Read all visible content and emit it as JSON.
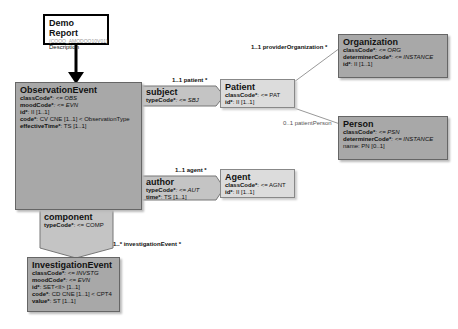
{
  "header": {
    "title": "Demo Report",
    "id": "(COOO_AMODOO10V01)",
    "description": "Description"
  },
  "observation_event": {
    "title": "ObservationEvent",
    "attrs": [
      {
        "name": "classCode*",
        "value": ": <= OBS"
      },
      {
        "name": "moodCode*",
        "value": ": <= EVN"
      },
      {
        "name": "id*",
        "value": ": II [1..1]"
      },
      {
        "name": "code*",
        "value": ": CV CNE [1..1] < ObservationType"
      },
      {
        "name": "effectiveTime*",
        "value": ": TS [1..1]"
      }
    ]
  },
  "subject": {
    "title": "subject",
    "attrs": [
      {
        "name": "typeCode*",
        "value": ": <= SBJ"
      }
    ],
    "label": "1..1 patient  *"
  },
  "patient": {
    "title": "Patient",
    "attrs": [
      {
        "name": "classCode*",
        "value": ": <= PAT"
      },
      {
        "name": "id*",
        "value": ": II [1..1]"
      }
    ]
  },
  "organization": {
    "title": "Organization",
    "label": "1..1 providerOrganization  *",
    "attrs": [
      {
        "name": "classCode*",
        "value": ": <= ORG"
      },
      {
        "name": "determinerCode*",
        "value": ": <= INSTANCE"
      },
      {
        "name": "id*",
        "value": ": II [1..1]"
      }
    ]
  },
  "person": {
    "title": "Person",
    "label": "0..1 patientPerson",
    "attrs": [
      {
        "name": "classCode*",
        "value": ": <= PSN"
      },
      {
        "name": "determinerCode*",
        "value": ": <= INSTANCE"
      },
      {
        "name": "name",
        "value": ": PN [0..1]"
      }
    ]
  },
  "author": {
    "title": "author",
    "label": "1..1 agent  *",
    "attrs": [
      {
        "name": "typeCode*",
        "value": ": <= AUT"
      },
      {
        "name": "time*",
        "value": ": TS [1..1]"
      }
    ]
  },
  "agent": {
    "title": "Agent",
    "attrs": [
      {
        "name": "classCode*",
        "value": ": <= AGNT"
      },
      {
        "name": "id*",
        "value": ": II [1..1]"
      }
    ]
  },
  "component": {
    "title": "component",
    "label": "1..* investigationEvent  *",
    "attrs": [
      {
        "name": "typeCode*",
        "value": ": <= COMP"
      }
    ]
  },
  "investigation_event": {
    "title": "InvestigationEvent",
    "attrs": [
      {
        "name": "classCode*",
        "value": ": <= INVSTG"
      },
      {
        "name": "moodCode*",
        "value": ": <= EVN"
      },
      {
        "name": "id*",
        "value": ": SET<II> [1..1]"
      },
      {
        "name": "code*",
        "value": ": CD CNE [1..1] < CPT4"
      },
      {
        "name": "value*",
        "value": ": ST [1..1]"
      }
    ]
  }
}
